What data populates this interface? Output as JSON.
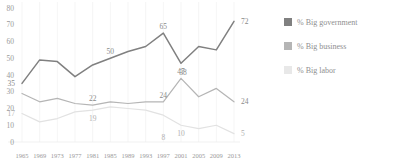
{
  "chart_data": {
    "type": "line",
    "title": "",
    "subtitle": "",
    "xlabel": "",
    "ylabel": "",
    "x": [
      1965,
      1969,
      1973,
      1977,
      1981,
      1985,
      1989,
      1993,
      1997,
      2001,
      2005,
      2009,
      2013
    ],
    "xticklabels": [
      "1965",
      "1969",
      "1973",
      "1977",
      "1981",
      "1985",
      "1989",
      "1993",
      "1997",
      "2001",
      "2005",
      "2009",
      "2013"
    ],
    "yticklabels": [
      "0",
      "10",
      "20",
      "30",
      "40",
      "50",
      "60",
      "70",
      "80"
    ],
    "ylim": [
      0,
      80
    ],
    "grid": "vertical-faint",
    "legend_position": "right",
    "series": [
      {
        "name": "% Big government",
        "color": "#808080",
        "values": [
          35,
          49,
          48,
          39,
          46,
          50,
          54,
          57,
          65,
          47,
          57,
          55,
          72
        ],
        "point_labels": [
          {
            "x": 1965,
            "value": 35
          },
          {
            "x": 1985,
            "value": 50
          },
          {
            "x": 1997,
            "value": 65
          },
          {
            "x": 2001,
            "value": 47
          },
          {
            "x": 2013,
            "value": 72
          }
        ]
      },
      {
        "name": "% Big business",
        "color": "#b5b5b5",
        "values": [
          29,
          24,
          26,
          23,
          22,
          24,
          23,
          24,
          24,
          38,
          27,
          32,
          24
        ],
        "point_labels": [
          {
            "x": 1981,
            "value": 22
          },
          {
            "x": 1997,
            "value": 24
          },
          {
            "x": 2001,
            "value": 38
          },
          {
            "x": 2013,
            "value": 24
          }
        ]
      },
      {
        "name": "% Big labor",
        "color": "#e2e2e2",
        "values": [
          17,
          12,
          14,
          18,
          19,
          21,
          20,
          19,
          16,
          10,
          8,
          10,
          5
        ],
        "point_labels": [
          {
            "x": 1965,
            "value": 17
          },
          {
            "x": 1981,
            "value": 19
          },
          {
            "x": 1997,
            "value": 8
          },
          {
            "x": 2001,
            "value": 10
          },
          {
            "x": 2013,
            "value": 5
          }
        ]
      }
    ]
  },
  "legend": {
    "items": [
      {
        "label": "% Big government",
        "color": "#808080"
      },
      {
        "label": "% Big business",
        "color": "#b5b5b5"
      },
      {
        "label": "% Big labor",
        "color": "#e8e8e8"
      }
    ]
  }
}
